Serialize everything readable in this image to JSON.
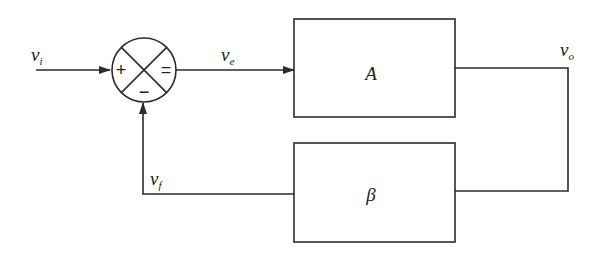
{
  "diagram": {
    "type": "feedback-block-diagram",
    "summing_junction": {
      "plus_sign": "+",
      "minus_sign": "−",
      "output_sign": "="
    },
    "blocks": {
      "forward": {
        "label": "A"
      },
      "feedback": {
        "label": "β"
      }
    },
    "signals": {
      "input": {
        "base": "v",
        "sub": "i"
      },
      "error": {
        "base": "v",
        "sub": "e"
      },
      "output": {
        "base": "v",
        "sub": "o"
      },
      "feedback": {
        "base": "v",
        "sub": "f"
      }
    },
    "colors": {
      "line": "#2b2b2b",
      "background": "#ffffff"
    }
  }
}
